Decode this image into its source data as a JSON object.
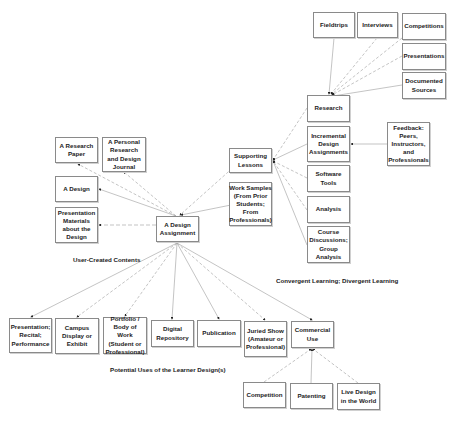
{
  "nodes": {
    "fieldtrips": "Fieldtrips",
    "interviews": "Interviews",
    "competitions": "Competitions",
    "presentations": "Presentations",
    "documented_sources": "Documented Sources",
    "research": "Research",
    "incremental": "Incremental Design Assignments",
    "feedback": "Feedback: Peers, Instructors, and Professionals",
    "supporting_lessons": "Supporting Lessons",
    "work_samples": "Work Samples (From Prior Students; From Professionals)",
    "software_tools": "Software Tools",
    "analysis": "Analysis",
    "course_discussions": "Course Discussions; Group Analysis",
    "research_paper": "A Research Paper",
    "personal_journal": "A Personal Research and Design Journal",
    "a_design": "A Design",
    "presentation_materials": "Presentation Materials about the Design",
    "design_assignment": "A Design Assignment",
    "presentation_recital": "Presentation; Recital; Performance",
    "campus_display": "Campus Display or Exhibit",
    "portfolio": "Portfolio / Body of Work (Student or Professional)",
    "digital_repository": "Digital Repository",
    "publication": "Publication",
    "juried_show": "Juried Show (Amateur or Professional)",
    "commercial_use": "Commercial Use",
    "competition": "Competition",
    "patenting": "Patenting",
    "live_design": "Live Design in the World"
  },
  "labels": {
    "user_created": "User-Created Contents",
    "convergent": "Convergent Learning; Divergent Learning",
    "potential_uses": "Potential Uses of the Learner Design(s)"
  }
}
